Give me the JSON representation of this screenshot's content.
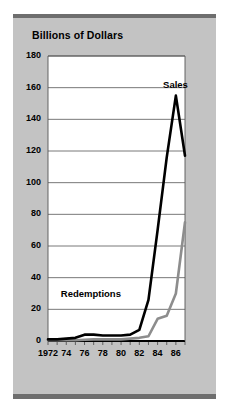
{
  "figure": {
    "background_color": "#ffffff",
    "panel_color": "#c3c3c3",
    "rule_color": "#6e6e6e",
    "plot_background": "#ffffff"
  },
  "chart_data": {
    "type": "line",
    "title": "Billions of Dollars",
    "xlabel": "",
    "ylabel": "",
    "grid": true,
    "legend_position": "inline-annotation",
    "xlim": [
      1972,
      1987
    ],
    "ylim": [
      0,
      180
    ],
    "ytick_values": [
      0,
      20,
      40,
      60,
      80,
      100,
      120,
      140,
      160,
      180
    ],
    "ytick_labels": [
      "0",
      "20",
      "40",
      "60",
      "80",
      "100",
      "120",
      "140",
      "160",
      "180"
    ],
    "xtick_values": [
      1972,
      1974,
      1976,
      1978,
      1980,
      1982,
      1984,
      1986
    ],
    "xtick_labels": [
      "1972",
      "74",
      "76",
      "78",
      "80",
      "82",
      "84",
      "86"
    ],
    "x_minor_ticks": [
      1972,
      1973,
      1974,
      1975,
      1976,
      1977,
      1978,
      1979,
      1980,
      1981,
      1982,
      1983,
      1984,
      1985,
      1986,
      1987
    ],
    "x": [
      1972,
      1973,
      1974,
      1975,
      1976,
      1977,
      1978,
      1979,
      1980,
      1981,
      1982,
      1983,
      1984,
      1985,
      1986,
      1987
    ],
    "series": [
      {
        "name": "Sales",
        "color": "#000000",
        "line_width": 2.6,
        "values": [
          1,
          1,
          1.5,
          2,
          4,
          4,
          3.5,
          3.5,
          3.5,
          4,
          7,
          26,
          70,
          116,
          155,
          117
        ],
        "label_text": "Sales"
      },
      {
        "name": "Redemptions",
        "color": "#8d8d8d",
        "line_width": 2.6,
        "values": [
          0.5,
          0.5,
          0.5,
          0.5,
          0.8,
          1,
          1,
          1,
          1,
          1.5,
          2,
          3,
          14,
          16,
          30,
          75
        ],
        "label_text": "Redemptions"
      }
    ],
    "annotations": [
      {
        "text": "Sales",
        "x": 1984.6,
        "y": 162
      },
      {
        "text": "Redemptions",
        "x": 1973.4,
        "y": 30
      }
    ]
  }
}
